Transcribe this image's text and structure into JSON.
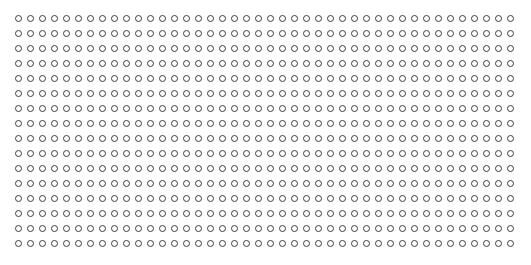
{
  "canvas": {
    "width": 531,
    "height": 265,
    "background_color": "#ffffff"
  },
  "pattern": {
    "name": "circle-dot-grid",
    "glyph": "open-circle",
    "columns": 42,
    "rows": 16,
    "origin_x": 18,
    "origin_y": 18,
    "spacing_x": 12,
    "spacing_y": 15,
    "dot_diameter": 7,
    "stroke_width": 1.5,
    "stroke_color": "#3c3c3c",
    "fill_color": "transparent",
    "total_dots": 672
  }
}
